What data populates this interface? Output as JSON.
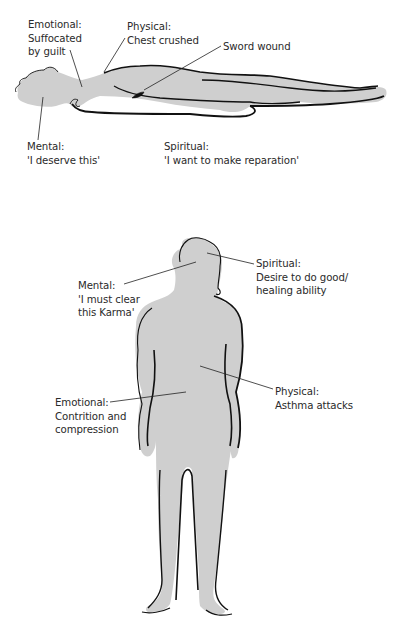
{
  "figures": {
    "lying_figure": {
      "description": "Figure lying down (past life)",
      "fill_color": "#cfcfcf",
      "outline_color": "#111111",
      "labels": [
        {
          "id": "emotional",
          "heading": "Emotional:",
          "lines": [
            "Suffocated",
            "by guilt"
          ]
        },
        {
          "id": "physical",
          "heading": "Physical:",
          "lines": [
            "Chest crushed"
          ]
        },
        {
          "id": "wound",
          "heading": "Sword wound",
          "lines": []
        },
        {
          "id": "mental",
          "heading": "Mental:",
          "lines": [
            "'I deserve this'"
          ]
        },
        {
          "id": "spiritual",
          "heading": "Spiritual:",
          "lines": [
            "'I want to make reparation'"
          ]
        }
      ]
    },
    "standing_figure": {
      "description": "Standing figure (present life)",
      "fill_color": "#cfcfcf",
      "outline_color": "#111111",
      "labels": [
        {
          "id": "spiritual",
          "heading": "Spiritual:",
          "lines": [
            "Desire to do good/",
            "healing ability"
          ]
        },
        {
          "id": "mental",
          "heading": "Mental:",
          "lines": [
            "'I must clear",
            "this Karma'"
          ]
        },
        {
          "id": "physical",
          "heading": "Physical:",
          "lines": [
            "Asthma attacks"
          ]
        },
        {
          "id": "emotional",
          "heading": "Emotional:",
          "lines": [
            "Contrition and",
            "compression"
          ]
        }
      ]
    }
  }
}
